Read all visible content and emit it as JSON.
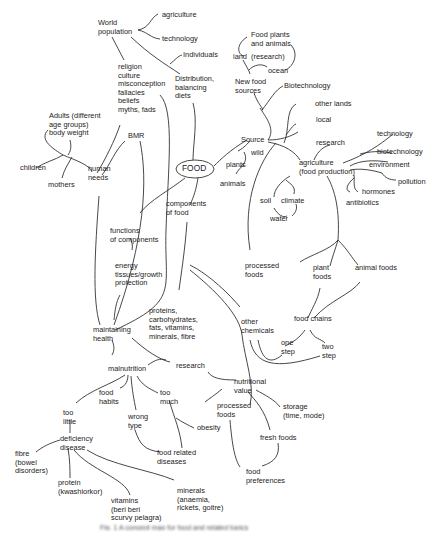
{
  "figure": {
    "type": "concept map",
    "central_node": "FOOD",
    "caption": "Fig. 1  A concept map for food and related topics"
  },
  "nodes": {
    "world_population": "World\npopulation",
    "agriculture_top": "agriculture",
    "technology_top": "technology",
    "individuals": "Individuals",
    "distribution": "Distribution,\nbalancing\ndiets",
    "religion": "religion\nculture\nmisconception\nfallacies\nbeliefs\nmyths, fads",
    "food_plants": "Food plants\nand animals",
    "land": "land",
    "research_paren": "(research)",
    "ocean": "ocean",
    "new_food_sources": "New food\nsources",
    "biotechnology_top": "Biotechnology",
    "other_lands": "other lands",
    "local": "local",
    "adults": "Adults (different\nage groups)\nbody weight",
    "bmr": "BMR",
    "children": "children",
    "mothers": "mothers",
    "human_needs": "human\nneeds",
    "food": "FOOD",
    "source": "Source",
    "wild": "wild",
    "plants": "plants",
    "animals": "animals",
    "research_ag": "research",
    "agriculture_prod": "agriculture\n(food production)",
    "technology_r": "technology",
    "biotechnology_r": "biotechnology",
    "environment": "environment",
    "pollution": "pollution",
    "hormones": "hormones",
    "antibiotics": "antibiotics",
    "soil": "soil",
    "climate": "climate",
    "water": "water",
    "components": "components\nof food",
    "functions": "functions\nof components",
    "energy": "energy\ntissues/growth\nprotection",
    "processed_top": "processed\nfoods",
    "plant_foods": "plant\nfoods",
    "animal_foods": "animal foods",
    "food_chains": "food chains",
    "one_step": "one\nstep",
    "two_step": "two\nstep",
    "nutrients": "proteins,\ncarbohydrates,\nfats, vitamins,\nminerals, fibre",
    "other_chemicals": "other\nchemicals",
    "maintaining_health": "maintaining\nhealth",
    "research_low": "research",
    "malnutrition": "malnutrition",
    "nutritional_value": "nutritional\nvalue",
    "food_habits": "food\nhabits",
    "too_much": "too\nmuch",
    "too_little": "too\nlittle",
    "wrong_type": "wrong\ntype",
    "obesity": "obesity",
    "processed_low": "processed\nfoods",
    "storage": "storage\n(time, mode)",
    "fresh_foods": "fresh foods",
    "deficiency": "deficiency\ndisease",
    "food_related": "food related\ndiseases",
    "fibre": "fibre\n(bowel\ndisorders)",
    "protein": "protein\n(kwashiorkor)",
    "vitamins": "vitamins\n(beri beri\nscurvy pelagra)",
    "minerals": "minerals\n(anaemia,\nrickets, goitre)",
    "food_preferences": "food\npreferences"
  }
}
